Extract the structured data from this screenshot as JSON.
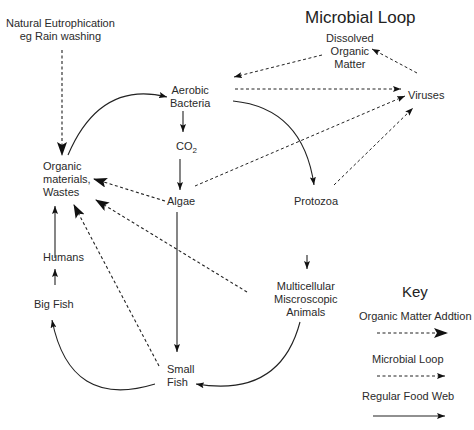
{
  "title": "Microbial Loop",
  "nodes": {
    "natural_eutrophication": {
      "line1": "Natural Eutrophication",
      "line2": "eg Rain washing"
    },
    "aerobic_bacteria": {
      "line1": "Aerobic",
      "line2": "Bacteria"
    },
    "co2": {
      "main": "CO",
      "sub": "2"
    },
    "organic_materials": {
      "line1": "Organic",
      "line2": "materials,",
      "line3": "Wastes"
    },
    "algae": "Algae",
    "protozoa": "Protozoa",
    "dissolved_organic_matter": {
      "line1": "Dissolved",
      "line2": "Organic",
      "line3": "Matter"
    },
    "viruses": "Viruses",
    "humans": "Humans",
    "big_fish": "Big Fish",
    "small_fish": {
      "line1": "Small",
      "line2": "Fish"
    },
    "multicellular": {
      "line1": "Multicellular",
      "line2": "Miscroscopic",
      "line3": "Animals"
    }
  },
  "key": {
    "title": "Key",
    "items": [
      {
        "label": "Organic Matter Addtion",
        "style": "dashed-large-arrow"
      },
      {
        "label": "Microbial Loop",
        "style": "dashed-small-arrow"
      },
      {
        "label": "Regular Food Web",
        "style": "solid-arrow"
      }
    ]
  },
  "edges": [
    {
      "from": "Natural Eutrophication",
      "to": "Organic materials, Wastes",
      "type": "Organic Matter Addtion"
    },
    {
      "from": "Organic materials, Wastes",
      "to": "Aerobic Bacteria",
      "type": "Regular Food Web"
    },
    {
      "from": "Aerobic Bacteria",
      "to": "CO2",
      "type": "Regular Food Web"
    },
    {
      "from": "CO2",
      "to": "Algae",
      "type": "Regular Food Web"
    },
    {
      "from": "Aerobic Bacteria",
      "to": "Protozoa",
      "type": "Regular Food Web"
    },
    {
      "from": "Aerobic Bacteria",
      "to": "Viruses",
      "type": "Microbial Loop"
    },
    {
      "from": "Dissolved Organic Matter",
      "to": "Aerobic Bacteria",
      "type": "Microbial Loop"
    },
    {
      "from": "Viruses",
      "to": "Dissolved Organic Matter",
      "type": "Microbial Loop"
    },
    {
      "from": "Algae",
      "to": "Viruses",
      "type": "Microbial Loop"
    },
    {
      "from": "Protozoa",
      "to": "Viruses",
      "type": "Microbial Loop"
    },
    {
      "from": "Algae",
      "to": "Organic materials, Wastes",
      "type": "Organic Matter Addtion"
    },
    {
      "from": "Multicellular Miscroscopic Animals",
      "to": "Organic materials, Wastes",
      "type": "Organic Matter Addtion"
    },
    {
      "from": "Small Fish",
      "to": "Organic materials, Wastes",
      "type": "Organic Matter Addtion"
    },
    {
      "from": "Algae",
      "to": "Small Fish",
      "type": "Regular Food Web"
    },
    {
      "from": "Protozoa",
      "to": "Multicellular Miscroscopic Animals",
      "type": "Regular Food Web"
    },
    {
      "from": "Multicellular Miscroscopic Animals",
      "to": "Small Fish",
      "type": "Regular Food Web"
    },
    {
      "from": "Small Fish",
      "to": "Big Fish",
      "type": "Regular Food Web"
    },
    {
      "from": "Big Fish",
      "to": "Humans",
      "type": "Regular Food Web"
    },
    {
      "from": "Humans",
      "to": "Organic materials, Wastes",
      "type": "Regular Food Web"
    }
  ]
}
